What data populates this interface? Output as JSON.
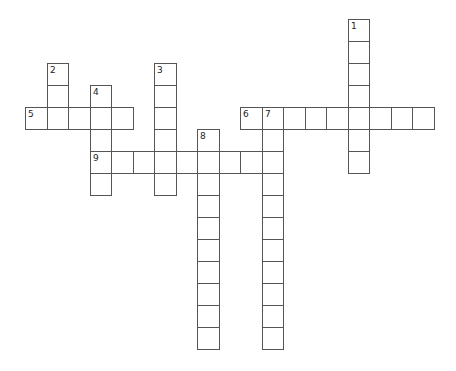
{
  "puzzle": {
    "grid": {
      "origin_x": 25,
      "origin_y": 19,
      "cell_w": 21.5,
      "cell_h": 22,
      "border_color": "#555555",
      "fill_color": "#ffffff"
    },
    "entries": [
      {
        "number": "1",
        "direction": "down",
        "row": 0,
        "col": 15,
        "length": 7
      },
      {
        "number": "2",
        "direction": "down",
        "row": 2,
        "col": 1,
        "length": 3
      },
      {
        "number": "3",
        "direction": "down",
        "row": 2,
        "col": 6,
        "length": 6
      },
      {
        "number": "4",
        "direction": "down",
        "row": 3,
        "col": 3,
        "length": 5
      },
      {
        "number": "5",
        "direction": "across",
        "row": 4,
        "col": 0,
        "length": 5
      },
      {
        "number": "6",
        "direction": "across",
        "row": 4,
        "col": 10,
        "length": 9
      },
      {
        "number": "7",
        "direction": "down",
        "row": 4,
        "col": 11,
        "length": 11
      },
      {
        "number": "8",
        "direction": "down",
        "row": 5,
        "col": 8,
        "length": 10
      },
      {
        "number": "9",
        "direction": "across",
        "row": 6,
        "col": 3,
        "length": 9
      }
    ]
  }
}
